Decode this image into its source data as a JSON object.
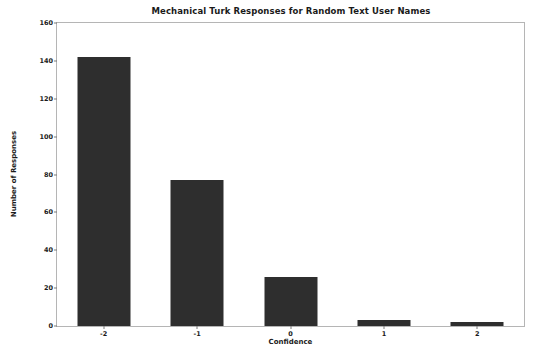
{
  "chart_data": {
    "type": "bar",
    "title": "Mechanical Turk Responses for Random Text User Names",
    "xlabel": "Confidence",
    "ylabel": "Number of Responses",
    "categories": [
      "-2",
      "-1",
      "0",
      "1",
      "2"
    ],
    "values": [
      142,
      77,
      26,
      3,
      2
    ],
    "ylim": [
      0,
      160
    ],
    "yticks": [
      "0",
      "20",
      "40",
      "60",
      "80",
      "100",
      "120",
      "140",
      "160"
    ],
    "ytick_values": [
      0,
      20,
      40,
      60,
      80,
      100,
      120,
      140,
      160
    ],
    "grid": false,
    "legend": null,
    "bar_color": "#2e2e2e",
    "axes_color": "#b5b5b5",
    "background_color": "#ffffff"
  }
}
